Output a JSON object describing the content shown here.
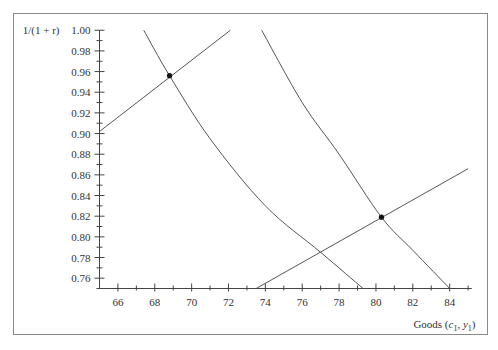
{
  "chart_data": {
    "type": "line",
    "title": "",
    "xlabel": "Goods (c1, y1)",
    "ylabel": "1/(1 + r)",
    "xlim": [
      65,
      85
    ],
    "ylim": [
      0.75,
      1.0
    ],
    "grid": false,
    "x_ticks": [
      66,
      68,
      70,
      72,
      74,
      76,
      78,
      80,
      82,
      84
    ],
    "y_ticks": [
      1.0,
      0.98,
      0.96,
      0.94,
      0.92,
      0.9,
      0.88,
      0.86,
      0.84,
      0.82,
      0.8,
      0.78,
      0.76
    ],
    "x_tick_labels": [
      "66",
      "68",
      "70",
      "72",
      "74",
      "76",
      "78",
      "80",
      "82",
      "84"
    ],
    "y_tick_labels": [
      "1.00",
      "0.98",
      "0.96",
      "0.94",
      "0.92",
      "0.90",
      "0.88",
      "0.86",
      "0.84",
      "0.82",
      "0.80",
      "0.78",
      "0.76"
    ],
    "series": [
      {
        "name": "demand-1",
        "points": [
          [
            67.4,
            1.0
          ],
          [
            68.8,
            0.956
          ],
          [
            71,
            0.895
          ],
          [
            74,
            0.83
          ],
          [
            77,
            0.785
          ],
          [
            79.3,
            0.75
          ]
        ]
      },
      {
        "name": "supply-1",
        "points": [
          [
            65,
            0.902
          ],
          [
            72.1,
            1.0
          ]
        ]
      },
      {
        "name": "demand-2",
        "points": [
          [
            73.8,
            1.0
          ],
          [
            76,
            0.93
          ],
          [
            78,
            0.88
          ],
          [
            80.3,
            0.819
          ],
          [
            82,
            0.787
          ],
          [
            84,
            0.75
          ]
        ]
      },
      {
        "name": "supply-2",
        "points": [
          [
            73.5,
            0.75
          ],
          [
            85,
            0.866
          ]
        ]
      }
    ],
    "equilibria": [
      {
        "name": "equilibrium-1",
        "x": 68.8,
        "y": 0.956
      },
      {
        "name": "equilibrium-2",
        "x": 80.3,
        "y": 0.819
      }
    ]
  },
  "labels": {
    "y_axis_title": "1/(1 + r)",
    "x_axis_title_prefix": "Goods (",
    "x_axis_c": "c",
    "x_axis_y": "y",
    "x_axis_sub": "1",
    "x_axis_suffix": ")"
  }
}
